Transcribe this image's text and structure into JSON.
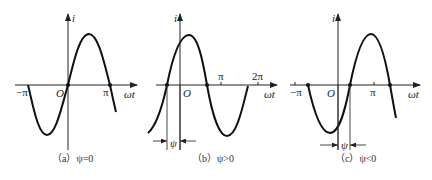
{
  "panels": [
    {
      "id": "a",
      "caption": "（a）ψ=0",
      "y_label": "i",
      "x_label": "ωt",
      "origin_label": "O",
      "ticks": [
        "−π",
        "π"
      ],
      "phase_label": ""
    },
    {
      "id": "b",
      "caption": "（b）ψ>0",
      "y_label": "i",
      "x_label": "ωt",
      "origin_label": "O",
      "ticks": [
        "π",
        "2π"
      ],
      "phase_label": "ψ"
    },
    {
      "id": "c",
      "caption": "（c）ψ<0",
      "y_label": "i",
      "x_label": "ωt",
      "origin_label": "O",
      "ticks": [
        "−π",
        "π"
      ],
      "phase_label": "ψ"
    }
  ]
}
